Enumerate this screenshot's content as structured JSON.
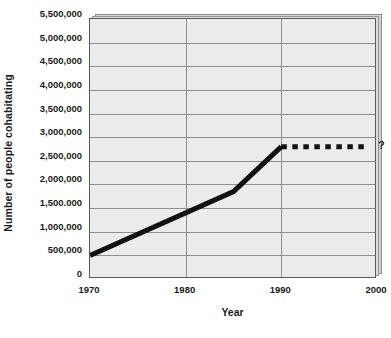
{
  "chart_data": {
    "type": "line",
    "title": "",
    "xlabel": "Year",
    "ylabel": "Number of people cohabitating",
    "xlim": [
      1970,
      2000
    ],
    "ylim": [
      0,
      5500000
    ],
    "grid": true,
    "legend": null,
    "x_ticks": [
      {
        "value": 1970,
        "label": "1970"
      },
      {
        "value": 1980,
        "label": "1980"
      },
      {
        "value": 1990,
        "label": "1990"
      },
      {
        "value": 2000,
        "label": "2000"
      }
    ],
    "x_gridlines": [
      1980,
      1990
    ],
    "y_ticks": [
      {
        "value": 0,
        "label": "0"
      },
      {
        "value": 500000,
        "label": "500,000"
      },
      {
        "value": 1000000,
        "label": "1,000,000"
      },
      {
        "value": 1500000,
        "label": "1,500.000"
      },
      {
        "value": 2000000,
        "label": "2,000,000"
      },
      {
        "value": 2500000,
        "label": "2,500,000"
      },
      {
        "value": 3000000,
        "label": "3,000,000"
      },
      {
        "value": 3500000,
        "label": "3,500,000"
      },
      {
        "value": 4000000,
        "label": "4,000,000"
      },
      {
        "value": 4500000,
        "label": "4,500,000"
      },
      {
        "value": 5000000,
        "label": "5,000,000"
      },
      {
        "value": 5500000,
        "label": "5,500,000"
      }
    ],
    "series": [
      {
        "name": "observed",
        "style": "solid",
        "color": "#111111",
        "points": [
          {
            "x": 1970,
            "y": 500000
          },
          {
            "x": 1985,
            "y": 1850000
          },
          {
            "x": 1990,
            "y": 2800000
          }
        ]
      },
      {
        "name": "projected",
        "style": "dashed",
        "color": "#111111",
        "points": [
          {
            "x": 1990,
            "y": 2800000
          },
          {
            "x": 1999,
            "y": 2800000
          }
        ]
      }
    ],
    "annotations": [
      {
        "text": "?",
        "x": 2000,
        "y": 2800000
      }
    ]
  },
  "colors": {
    "plot_background": "#ebebeb",
    "gridline": "#8e8e8e",
    "axis_border": "#5a5a5a",
    "series_line": "#111111",
    "bevel_mid": "#dedede",
    "bevel_back": "#d5d5d5"
  }
}
